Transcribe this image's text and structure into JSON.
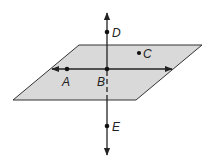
{
  "diagram": {
    "plane": {
      "fill": "#d9d9d9",
      "stroke": "#333333",
      "corners": [
        [
          79,
          45
        ],
        [
          202,
          45
        ],
        [
          136,
          100
        ],
        [
          13,
          100
        ]
      ]
    },
    "points": [
      {
        "label": "A",
        "x": 67,
        "y": 69,
        "lx": 61,
        "ly": 86
      },
      {
        "label": "B",
        "x": 107,
        "y": 69,
        "lx": 96,
        "ly": 86
      },
      {
        "label": "C",
        "x": 139,
        "y": 53,
        "lx": 144,
        "ly": 58
      },
      {
        "label": "D",
        "x": 107,
        "y": 32,
        "lx": 112,
        "ly": 37
      },
      {
        "label": "E",
        "x": 107,
        "y": 126,
        "lx": 112,
        "ly": 131
      }
    ],
    "lines": [
      {
        "name": "line-AB",
        "from": [
          51,
          69
        ],
        "to": [
          172,
          69
        ],
        "arrows": "both"
      },
      {
        "name": "line-DE",
        "from": [
          107,
          13
        ],
        "to": [
          107,
          155
        ],
        "arrows": "both",
        "hidden_segment": [
          69,
          100
        ]
      }
    ]
  }
}
